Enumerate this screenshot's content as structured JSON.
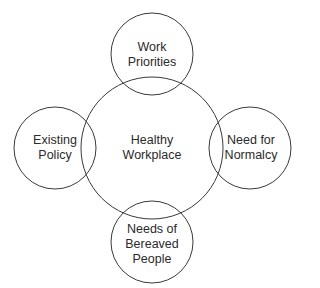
{
  "diagram": {
    "type": "venn-hub",
    "stroke_color": "#3a3a3a",
    "background": "#ffffff",
    "center": {
      "label": "Healthy\nWorkplace",
      "cx": 152,
      "cy": 148,
      "r": 71
    },
    "nodes": [
      {
        "id": "top",
        "label": "Work\nPriorities",
        "cx": 152,
        "cy": 54,
        "r": 41
      },
      {
        "id": "left",
        "label": "Existing\nPolicy",
        "cx": 55,
        "cy": 148,
        "r": 41
      },
      {
        "id": "right",
        "label": "Need for\nNormalcy",
        "cx": 250,
        "cy": 148,
        "r": 41
      },
      {
        "id": "bottom",
        "label": "Needs of\nBereaved\nPeople",
        "cx": 152,
        "cy": 242,
        "r": 41
      }
    ]
  }
}
